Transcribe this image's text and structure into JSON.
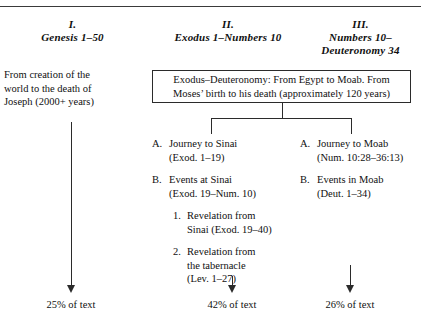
{
  "columns": [
    {
      "numeral": "I.",
      "reference": "Genesis 1–50"
    },
    {
      "numeral": "II.",
      "reference": "Exodus 1–Numbers 10"
    },
    {
      "numeral": "III.",
      "reference_line1": "Numbers 10–",
      "reference_line2": "Deuteronomy 34"
    }
  ],
  "left_column": {
    "paragraph_line1": "From creation of the",
    "paragraph_line2": "world to the death of",
    "paragraph_line3": "Joseph (2000+ years)"
  },
  "summary_box": {
    "line1": "Exodus–Deuteronomy: From Egypt to Moab. From",
    "line2": "Moses’ birth to his death (approximately 120 years)"
  },
  "outline_middle": [
    {
      "marker": "A.",
      "lines": [
        "Journey to Sinai",
        "(Exod. 1–19)"
      ],
      "sub": []
    },
    {
      "marker": "B.",
      "lines": [
        "Events at Sinai",
        "(Exod. 19–Num. 10)"
      ],
      "sub": [
        {
          "marker": "1.",
          "lines": [
            "Revelation from",
            "Sinai (Exod. 19–40)"
          ]
        },
        {
          "marker": "2.",
          "lines": [
            "Revelation from",
            "the tabernacle",
            "(Lev. 1–27)"
          ]
        }
      ]
    }
  ],
  "outline_right": [
    {
      "marker": "A.",
      "lines": [
        "Journey to Moab",
        "(Num. 10:28–36:13)"
      ]
    },
    {
      "marker": "B.",
      "lines": [
        "Events in Moab",
        "(Deut. 1–34)"
      ]
    }
  ],
  "percentages": [
    "25% of text",
    "42% of text",
    "26% of text"
  ],
  "colors": {
    "ink": "#101010",
    "rule": "#2b2b2b",
    "background": "#ffffff"
  }
}
